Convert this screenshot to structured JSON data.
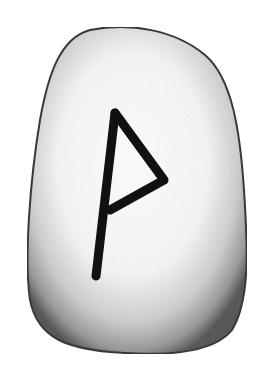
{
  "image": {
    "subject": "rune stone",
    "rune_name": "Wunjo",
    "rune_glyph": "ᚹ",
    "colors": {
      "background": "#ffffff",
      "stone_light": "#ffffff",
      "stone_shadow": "#6e6e6e",
      "rune_stroke": "#111111"
    }
  }
}
